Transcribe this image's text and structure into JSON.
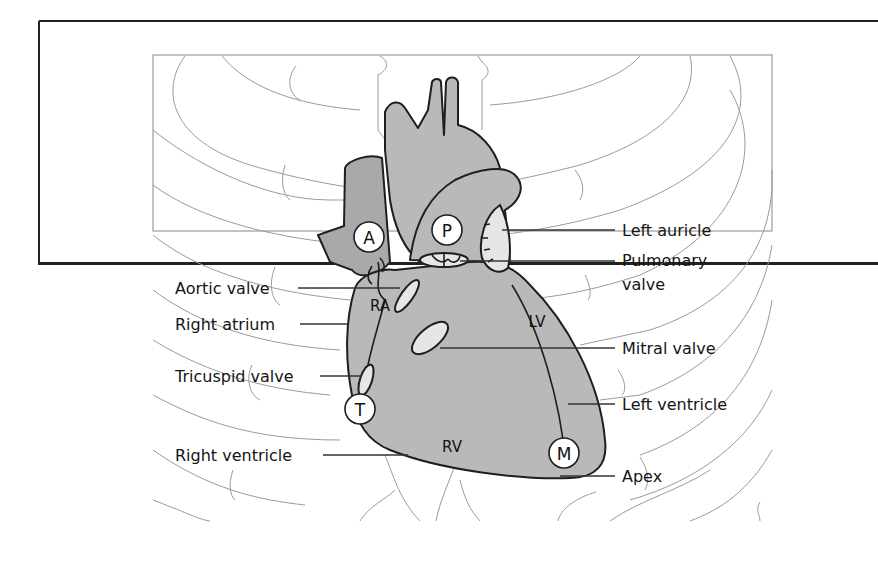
{
  "figure": {
    "markers": [
      {
        "id": "A",
        "meaning": "Aortic area"
      },
      {
        "id": "P",
        "meaning": "Pulmonary area"
      },
      {
        "id": "T",
        "meaning": "Tricuspid area"
      },
      {
        "id": "M",
        "meaning": "Mitral area"
      }
    ],
    "chambers": [
      "RA",
      "LV",
      "RV"
    ],
    "labels_left": [
      "Aortic valve",
      "Right atrium",
      "Tricuspid valve",
      "Right ventricle"
    ],
    "labels_right": [
      "Left auricle",
      "Pulmonary",
      "valve",
      "Mitral valve",
      "Left ventricle",
      "Apex"
    ],
    "colors": {
      "heart_fill": "#b9b9b9",
      "valve_fill": "#e6e6e6",
      "outline": "#1e1e1e",
      "rib_line": "#9a9a9a",
      "background": "#ffffff"
    }
  }
}
